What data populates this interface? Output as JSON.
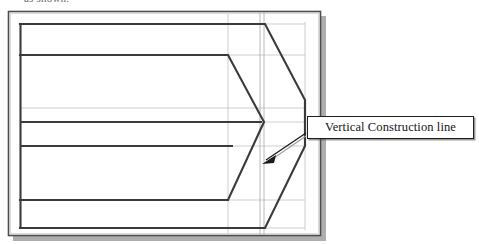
{
  "figure": {
    "caption_above": "as shown.",
    "callout": {
      "label": "Vertical Construction line",
      "pointer": "arrow-pointing-down-left"
    },
    "colors": {
      "paper": "#ffffff",
      "object_line": "#3a3a3a",
      "frame_line": "#4a4a4a",
      "construction_line": "#b9b9b9",
      "drop_shadow": "#9a9a9a",
      "callout_border": "#1d1d1d",
      "text": "#141414"
    },
    "elements": {
      "outer_frame": "page-border-rectangle",
      "drop_shadow": "page-drop-shadow",
      "construction_grid": "light-gray-construction-grid",
      "vertical_construction_lines_count": "2",
      "object_outline": "arrow-head-block-profile",
      "inner_chevron": "inner-chevron-profile"
    }
  }
}
